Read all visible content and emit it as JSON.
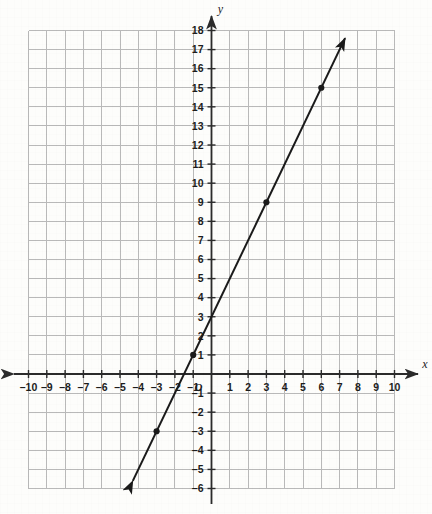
{
  "chart_data": {
    "type": "line",
    "title": "",
    "xlabel": "x",
    "ylabel": "y",
    "xlim": [
      -10,
      10
    ],
    "ylim": [
      -6,
      18
    ],
    "grid": true,
    "legend": null,
    "origin_label": "O",
    "x_ticks": [
      -10,
      -9,
      -8,
      -7,
      -6,
      -5,
      -4,
      -3,
      -2,
      -1,
      1,
      2,
      3,
      4,
      5,
      6,
      7,
      8,
      9,
      10
    ],
    "y_ticks": [
      -6,
      -5,
      -4,
      -3,
      -2,
      -1,
      1,
      2,
      3,
      4,
      5,
      6,
      7,
      8,
      9,
      10,
      11,
      12,
      13,
      14,
      15,
      16,
      17,
      18
    ],
    "x_tick_labels": [
      "–10",
      "–9",
      "–8",
      "–7",
      "–6",
      "–5",
      "–4",
      "–3",
      "–2",
      "–1",
      "1",
      "2",
      "3",
      "4",
      "5",
      "6",
      "7",
      "8",
      "9",
      "10"
    ],
    "y_tick_labels": [
      "–6",
      "–5",
      "–4",
      "–3",
      "–2",
      "–1",
      "1",
      "2",
      "3",
      "4",
      "5",
      "6",
      "7",
      "8",
      "9",
      "10",
      "11",
      "12",
      "13",
      "14",
      "15",
      "16",
      "17",
      "18"
    ],
    "series": [
      {
        "name": "line",
        "equation": "y = 2x + 3",
        "slope": 2,
        "intercept": 3,
        "x_start": -4.3,
        "y_start": -5.6,
        "x_end": 7.3,
        "y_end": 17.6,
        "arrow_start": true,
        "arrow_end": true,
        "points": [
          {
            "x": -3,
            "y": -3
          },
          {
            "x": -1,
            "y": 1
          },
          {
            "x": 3,
            "y": 9
          },
          {
            "x": 6,
            "y": 15
          }
        ]
      }
    ],
    "colors": {
      "line": "#1a1a1a",
      "grid": "#b9b9b9",
      "axis": "#2b2b2b",
      "background": "#fdfdfb",
      "label": "#1c1c1c"
    }
  }
}
